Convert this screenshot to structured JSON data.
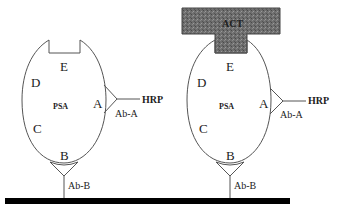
{
  "figure": {
    "panels": [
      {
        "id": "left",
        "antigen_label": "PSA",
        "epitopes": [
          "A",
          "B",
          "C",
          "D",
          "E"
        ],
        "capture_antibody": "Ab-B",
        "detection_antibody": "Ab-A",
        "enzyme_label": "HRP",
        "bound_inhibitor": null
      },
      {
        "id": "right",
        "antigen_label": "PSA",
        "epitopes": [
          "A",
          "B",
          "C",
          "D",
          "E"
        ],
        "capture_antibody": "Ab-B",
        "detection_antibody": "Ab-A",
        "enzyme_label": "HRP",
        "bound_inhibitor": "ACT"
      }
    ],
    "colors": {
      "line": "#555555",
      "surface": "#000000",
      "act_fill": "#6b6b6b",
      "background": "#ffffff"
    }
  }
}
